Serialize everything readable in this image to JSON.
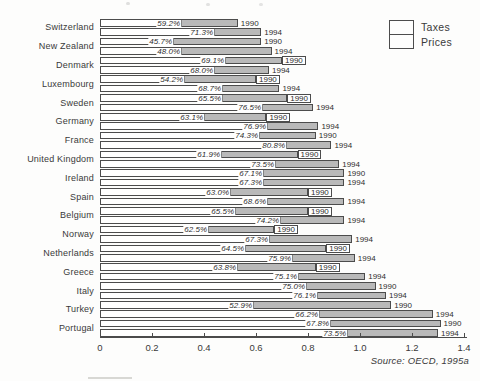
{
  "figure": {
    "source_note": "Source: OECD, 1995a",
    "legend": [
      {
        "label": "Taxes",
        "color": "#ffffff"
      },
      {
        "label": "Prices",
        "color": "#b9b9b9"
      }
    ]
  },
  "chart_data": {
    "type": "bar",
    "orientation": "horizontal",
    "stacked": true,
    "x_axis": {
      "min": 0,
      "max": 1.4,
      "tick_values": [
        0,
        0.2,
        0.4,
        0.6,
        0.8,
        1.0,
        1.2,
        1.4
      ],
      "tick_labels": [
        "0",
        "0.2",
        "0.4",
        "0.6",
        "0.8",
        "1.0",
        "1.2",
        "1.4"
      ]
    },
    "legend_entries": [
      "Taxes",
      "Prices"
    ],
    "source": "Source: OECD, 1995a",
    "countries": [
      {
        "name": "Switzerland",
        "bars": [
          {
            "year": "1990",
            "tax_pct_label": "59.2%",
            "tax_share": 0.592,
            "total": 0.53,
            "boxed_year": false
          },
          {
            "year": "1994",
            "tax_pct_label": "71.3%",
            "tax_share": 0.713,
            "total": 0.62,
            "boxed_year": false
          }
        ]
      },
      {
        "name": "New Zealand",
        "bars": [
          {
            "year": "1990",
            "tax_pct_label": "45.7%",
            "tax_share": 0.457,
            "total": 0.62,
            "boxed_year": false
          },
          {
            "year": "1994",
            "tax_pct_label": "48.0%",
            "tax_share": 0.48,
            "total": 0.66,
            "boxed_year": false
          }
        ]
      },
      {
        "name": "Denmark",
        "bars": [
          {
            "year": "1990",
            "tax_pct_label": "69.1%",
            "tax_share": 0.691,
            "total": 0.7,
            "boxed_year": true
          },
          {
            "year": "1994",
            "tax_pct_label": "68.0%",
            "tax_share": 0.68,
            "total": 0.65,
            "boxed_year": false
          }
        ]
      },
      {
        "name": "Luxembourg",
        "bars": [
          {
            "year": "1990",
            "tax_pct_label": "54.2%",
            "tax_share": 0.542,
            "total": 0.6,
            "boxed_year": true
          },
          {
            "year": "1994",
            "tax_pct_label": "68.7%",
            "tax_share": 0.687,
            "total": 0.69,
            "boxed_year": false
          }
        ]
      },
      {
        "name": "Sweden",
        "bars": [
          {
            "year": "1990",
            "tax_pct_label": "65.5%",
            "tax_share": 0.655,
            "total": 0.72,
            "boxed_year": true
          },
          {
            "year": "1994",
            "tax_pct_label": "76.5%",
            "tax_share": 0.765,
            "total": 0.82,
            "boxed_year": false
          }
        ]
      },
      {
        "name": "Germany",
        "bars": [
          {
            "year": "1990",
            "tax_pct_label": "63.1%",
            "tax_share": 0.631,
            "total": 0.64,
            "boxed_year": true
          },
          {
            "year": "1994",
            "tax_pct_label": "76.9%",
            "tax_share": 0.769,
            "total": 0.84,
            "boxed_year": false
          }
        ]
      },
      {
        "name": "France",
        "bars": [
          {
            "year": "1990",
            "tax_pct_label": "74.3%",
            "tax_share": 0.743,
            "total": 0.83,
            "boxed_year": false
          },
          {
            "year": "1994",
            "tax_pct_label": "80.8%",
            "tax_share": 0.808,
            "total": 0.89,
            "boxed_year": false
          }
        ]
      },
      {
        "name": "United Kingdom",
        "bars": [
          {
            "year": "1990",
            "tax_pct_label": "61.9%",
            "tax_share": 0.619,
            "total": 0.76,
            "boxed_year": true
          },
          {
            "year": "1994",
            "tax_pct_label": "73.5%",
            "tax_share": 0.735,
            "total": 0.92,
            "boxed_year": false
          }
        ]
      },
      {
        "name": "Ireland",
        "bars": [
          {
            "year": "1990",
            "tax_pct_label": "67.1%",
            "tax_share": 0.671,
            "total": 0.94,
            "boxed_year": false
          },
          {
            "year": "1994",
            "tax_pct_label": "67.3%",
            "tax_share": 0.673,
            "total": 0.94,
            "boxed_year": false
          }
        ]
      },
      {
        "name": "Spain",
        "bars": [
          {
            "year": "1990",
            "tax_pct_label": "63.0%",
            "tax_share": 0.63,
            "total": 0.8,
            "boxed_year": true
          },
          {
            "year": "1994",
            "tax_pct_label": "68.6%",
            "tax_share": 0.686,
            "total": 0.94,
            "boxed_year": false
          }
        ]
      },
      {
        "name": "Belgium",
        "bars": [
          {
            "year": "1990",
            "tax_pct_label": "65.5%",
            "tax_share": 0.655,
            "total": 0.8,
            "boxed_year": true
          },
          {
            "year": "1994",
            "tax_pct_label": "74.2%",
            "tax_share": 0.742,
            "total": 0.94,
            "boxed_year": false
          }
        ]
      },
      {
        "name": "Norway",
        "bars": [
          {
            "year": "1990",
            "tax_pct_label": "62.5%",
            "tax_share": 0.625,
            "total": 0.67,
            "boxed_year": true
          },
          {
            "year": "1994",
            "tax_pct_label": "67.3%",
            "tax_share": 0.673,
            "total": 0.97,
            "boxed_year": false
          }
        ]
      },
      {
        "name": "Netherlands",
        "bars": [
          {
            "year": "1990",
            "tax_pct_label": "64.5%",
            "tax_share": 0.645,
            "total": 0.87,
            "boxed_year": true
          },
          {
            "year": "1994",
            "tax_pct_label": "75.9%",
            "tax_share": 0.759,
            "total": 0.98,
            "boxed_year": false
          }
        ]
      },
      {
        "name": "Greece",
        "bars": [
          {
            "year": "1990",
            "tax_pct_label": "63.8%",
            "tax_share": 0.638,
            "total": 0.83,
            "boxed_year": true
          },
          {
            "year": "1994",
            "tax_pct_label": "75.1%",
            "tax_share": 0.751,
            "total": 1.02,
            "boxed_year": false
          }
        ]
      },
      {
        "name": "Italy",
        "bars": [
          {
            "year": "1990",
            "tax_pct_label": "75.0%",
            "tax_share": 0.75,
            "total": 1.06,
            "boxed_year": false
          },
          {
            "year": "1994",
            "tax_pct_label": "76.1%",
            "tax_share": 0.761,
            "total": 1.1,
            "boxed_year": false
          }
        ]
      },
      {
        "name": "Turkey",
        "bars": [
          {
            "year": "1990",
            "tax_pct_label": "52.9%",
            "tax_share": 0.529,
            "total": 1.12,
            "boxed_year": false
          },
          {
            "year": "1994",
            "tax_pct_label": "66.2%",
            "tax_share": 0.662,
            "total": 1.28,
            "boxed_year": false
          }
        ]
      },
      {
        "name": "Portugal",
        "bars": [
          {
            "year": "1990",
            "tax_pct_label": "67.8%",
            "tax_share": 0.678,
            "total": 1.31,
            "boxed_year": false
          },
          {
            "year": "1994",
            "tax_pct_label": "73.5%",
            "tax_share": 0.735,
            "total": 1.3,
            "boxed_year": false
          }
        ]
      }
    ]
  }
}
